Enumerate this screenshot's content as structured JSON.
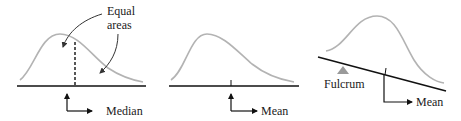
{
  "panels": [
    {
      "id": "median",
      "annotation_line1": "Equal",
      "annotation_line2": "areas",
      "label": "Median"
    },
    {
      "id": "mean",
      "label": "Mean"
    },
    {
      "id": "balance",
      "fulcrum_label": "Fulcrum",
      "label": "Mean"
    }
  ],
  "colors": {
    "curve": "#b3b3b3",
    "axis": "#111111",
    "fulcrum": "#9a9a9a",
    "text": "#1a1a1a"
  }
}
